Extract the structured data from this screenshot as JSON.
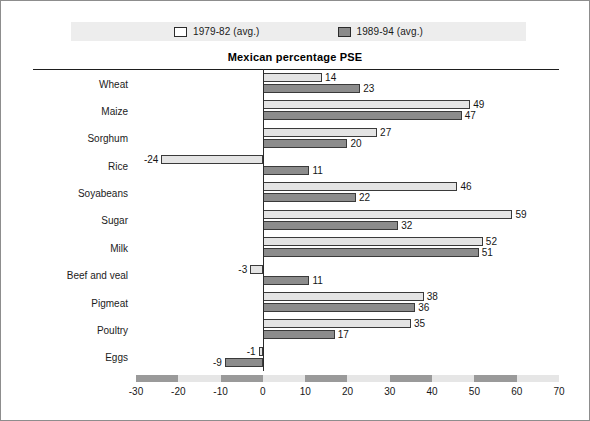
{
  "legend": {
    "items": [
      {
        "label": "1979-82 (avg.)",
        "swatch": "light",
        "color": "#ffffff"
      },
      {
        "label": "1989-94 (avg.)",
        "swatch": "dark",
        "color": "#8a8a8a"
      }
    ]
  },
  "colors": {
    "series_1979_82": "#e4e4e4",
    "series_1989_94": "#8c8c8c",
    "outline": "#3a3a3a",
    "legend_band": "#ededed",
    "axis_band_light": "#e6e6e6",
    "axis_band_dark": "#9a9a9a"
  },
  "chart_data": {
    "type": "bar",
    "orientation": "horizontal",
    "title": "Mexican percentage PSE",
    "xlabel": "",
    "ylabel": "",
    "xlim": [
      -30,
      70
    ],
    "xticks": [
      -30,
      -20,
      -10,
      0,
      10,
      20,
      30,
      40,
      50,
      60,
      70
    ],
    "xtick_labels": [
      "-30",
      "-20",
      "-10",
      "0",
      "10",
      "20",
      "30",
      "40",
      "50",
      "60",
      "70"
    ],
    "grid": false,
    "legend_position": "top",
    "categories": [
      "Wheat",
      "Maize",
      "Sorghum",
      "Rice",
      "Soyabeans",
      "Sugar",
      "Milk",
      "Beef and veal",
      "Pigmeat",
      "Poultry",
      "Eggs"
    ],
    "series": [
      {
        "name": "1979-82 (avg.)",
        "values": [
          14,
          49,
          27,
          -24,
          46,
          59,
          52,
          -3,
          38,
          35,
          -1
        ],
        "labels": [
          "14",
          "49",
          "27",
          "-24",
          "46",
          "59",
          "52",
          "-3",
          "38",
          "35",
          "-1"
        ]
      },
      {
        "name": "1989-94 (avg.)",
        "values": [
          23,
          47,
          20,
          11,
          22,
          32,
          51,
          11,
          36,
          17,
          -9
        ],
        "labels": [
          "23",
          "47",
          "20",
          "11",
          "22",
          "32",
          "51",
          "11",
          "36",
          "17",
          "-9"
        ]
      }
    ]
  }
}
